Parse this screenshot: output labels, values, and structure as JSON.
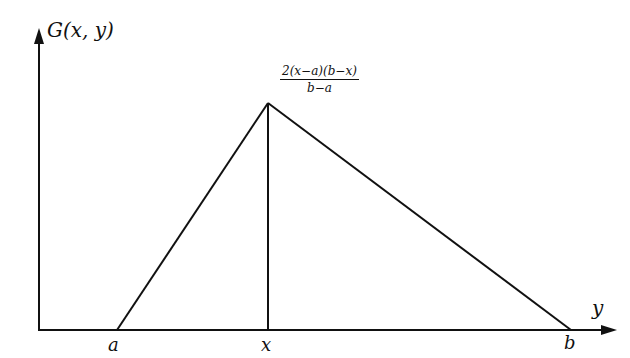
{
  "diagram": {
    "y_axis_label": "G(x, y)",
    "x_axis_label": "y",
    "peak_label": {
      "numerator": "2(x−a)(b−x)",
      "denominator": "b−a"
    },
    "tick_labels": {
      "a": "a",
      "x": "x",
      "b": "b"
    },
    "stroke_color": "#111111",
    "background": "#ffffff"
  }
}
